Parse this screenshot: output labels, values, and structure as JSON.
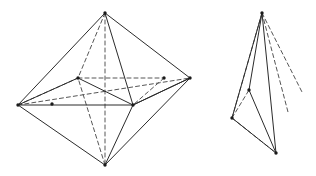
{
  "figure": {
    "caption": "",
    "background_color": "#ffffff",
    "solid_edge_color": "#2b2b2b",
    "dashed_edge_color": "#565656",
    "vertex_color": "#1a1a1a",
    "canvas": {
      "width": 316,
      "height": 176
    }
  },
  "chart_data": {
    "type": "diagram",
    "xlabel": "",
    "ylabel": "",
    "shapes": [
      {
        "name": "octahedron",
        "label": "left-octahedron",
        "vertices": {
          "top": [
            105,
            13
          ],
          "bottom": [
            105,
            165
          ],
          "left": [
            18,
            105
          ],
          "right": [
            190,
            78
          ],
          "inner_top_left": [
            78,
            78
          ],
          "inner_top_right": [
            164,
            78
          ],
          "inner_bottom_left": [
            52,
            104
          ],
          "inner_bottom_right": [
            133,
            105
          ]
        },
        "solid_edges": [
          [
            "top",
            "left"
          ],
          [
            "top",
            "right"
          ],
          [
            "bottom",
            "left"
          ],
          [
            "bottom",
            "right"
          ],
          [
            "top",
            "inner_bottom_right"
          ],
          [
            "bottom",
            "inner_bottom_right"
          ],
          [
            "left",
            "inner_bottom_right"
          ],
          [
            "right",
            "inner_bottom_right"
          ],
          [
            "left",
            "inner_top_left"
          ],
          [
            "inner_top_left",
            "inner_bottom_right"
          ],
          [
            "inner_bottom_right",
            "right"
          ]
        ],
        "dashed_edges": [
          [
            "top",
            "inner_top_left"
          ],
          [
            "bottom",
            "inner_top_left"
          ],
          [
            "top",
            "bottom"
          ],
          [
            "inner_top_left",
            "inner_top_right"
          ],
          [
            "left",
            "right"
          ],
          [
            "left",
            "inner_top_left"
          ],
          [
            "inner_top_right",
            "inner_bottom_right"
          ]
        ]
      },
      {
        "name": "tetrahedron",
        "label": "right-tetrahedron",
        "vertices": {
          "apex": [
            262,
            13
          ],
          "left": [
            232,
            118
          ],
          "bottom": [
            276,
            153
          ],
          "mid": [
            249,
            90
          ],
          "ray_end_a": [
            302,
            92
          ],
          "ray_end_b": [
            288,
            112
          ]
        },
        "solid_edges": [
          [
            "apex",
            "left"
          ],
          [
            "apex",
            "bottom"
          ],
          [
            "left",
            "bottom"
          ],
          [
            "apex",
            "mid"
          ],
          [
            "mid",
            "bottom"
          ]
        ],
        "dashed_edges": [
          [
            "apex",
            "ray_end_a"
          ],
          [
            "apex",
            "ray_end_b"
          ],
          [
            "left",
            "mid"
          ],
          [
            "apex",
            "left"
          ],
          [
            "left",
            "bottom"
          ]
        ]
      }
    ]
  }
}
